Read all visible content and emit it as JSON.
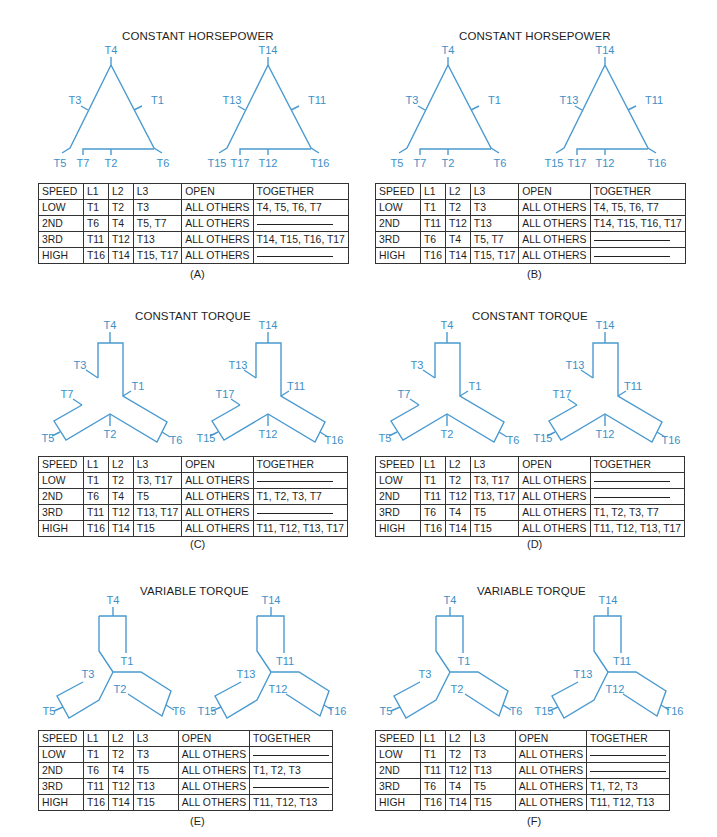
{
  "wire_color": "#4a9ad0",
  "panels": [
    {
      "id": "A",
      "caption": "(A)",
      "title": "CONSTANT HORSEPOWER",
      "type": "delta",
      "left_labels": {
        "top": "T4",
        "left": "T3",
        "right": "T1",
        "bl": "T5",
        "bm1": "T7",
        "bm2": "T2",
        "br": "T6"
      },
      "right_labels": {
        "top": "T14",
        "left": "T13",
        "right": "T11",
        "bl": "T15",
        "bm1": "T17",
        "bm2": "T12",
        "br": "T16"
      },
      "table": {
        "headers": [
          "SPEED",
          "L1",
          "L2",
          "L3",
          "OPEN",
          "TOGETHER"
        ],
        "rows": [
          [
            "LOW",
            "T1",
            "T2",
            "T3",
            "ALL OTHERS",
            "T4, T5, T6, T7"
          ],
          [
            "2ND",
            "T6",
            "T4",
            "T5, T7",
            "ALL OTHERS",
            "—"
          ],
          [
            "3RD",
            "T11",
            "T12",
            "T13",
            "ALL OTHERS",
            "T14, T15, T16, T17"
          ],
          [
            "HIGH",
            "T16",
            "T14",
            "T15, T17",
            "ALL OTHERS",
            "—"
          ]
        ]
      }
    },
    {
      "id": "B",
      "caption": "(B)",
      "title": "CONSTANT HORSEPOWER",
      "type": "delta",
      "left_labels": {
        "top": "T4",
        "left": "T3",
        "right": "T1",
        "bl": "T5",
        "bm1": "T7",
        "bm2": "T2",
        "br": "T6"
      },
      "right_labels": {
        "top": "T14",
        "left": "T13",
        "right": "T11",
        "bl": "T15",
        "bm1": "T17",
        "bm2": "T12",
        "br": "T16"
      },
      "table": {
        "headers": [
          "SPEED",
          "L1",
          "L2",
          "L3",
          "OPEN",
          "TOGETHER"
        ],
        "rows": [
          [
            "LOW",
            "T1",
            "T2",
            "T3",
            "ALL OTHERS",
            "T4, T5, T6, T7"
          ],
          [
            "2ND",
            "T11",
            "T12",
            "T13",
            "ALL OTHERS",
            "T14, T15, T16, T17"
          ],
          [
            "3RD",
            "T6",
            "T4",
            "T5, T7",
            "ALL OTHERS",
            "—"
          ],
          [
            "HIGH",
            "T16",
            "T14",
            "T15, T17",
            "ALL OTHERS",
            "—"
          ]
        ]
      }
    },
    {
      "id": "C",
      "caption": "(C)",
      "title": "CONSTANT TORQUE",
      "type": "wye-ct",
      "left_labels": {
        "top": "T4",
        "t3": "T3",
        "t1": "T1",
        "t7": "T7",
        "bl": "T5",
        "bm": "T2",
        "br": "T6"
      },
      "right_labels": {
        "top": "T14",
        "t3": "T13",
        "t1": "T11",
        "t7": "T17",
        "bl": "T15",
        "bm": "T12",
        "br": "T16"
      },
      "table": {
        "headers": [
          "SPEED",
          "L1",
          "L2",
          "L3",
          "OPEN",
          "TOGETHER"
        ],
        "rows": [
          [
            "LOW",
            "T1",
            "T2",
            "T3, T17",
            "ALL OTHERS",
            "—"
          ],
          [
            "2ND",
            "T6",
            "T4",
            "T5",
            "ALL OTHERS",
            "T1, T2, T3, T7"
          ],
          [
            "3RD",
            "T11",
            "T12",
            "T13, T17",
            "ALL OTHERS",
            "—"
          ],
          [
            "HIGH",
            "T16",
            "T14",
            "T15",
            "ALL OTHERS",
            "T11, T12, T13, T17"
          ]
        ]
      }
    },
    {
      "id": "D",
      "caption": "(D)",
      "title": "CONSTANT TORQUE",
      "type": "wye-ct",
      "left_labels": {
        "top": "T4",
        "t3": "T3",
        "t1": "T1",
        "t7": "T7",
        "bl": "T5",
        "bm": "T2",
        "br": "T6"
      },
      "right_labels": {
        "top": "T14",
        "t3": "T13",
        "t1": "T11",
        "t7": "T17",
        "bl": "T15",
        "bm": "T12",
        "br": "T16"
      },
      "table": {
        "headers": [
          "SPEED",
          "L1",
          "L2",
          "L3",
          "OPEN",
          "TOGETHER"
        ],
        "rows": [
          [
            "LOW",
            "T1",
            "T2",
            "T3, T17",
            "ALL OTHERS",
            "—"
          ],
          [
            "2ND",
            "T11",
            "T12",
            "T13, T17",
            "ALL OTHERS",
            "—"
          ],
          [
            "3RD",
            "T6",
            "T4",
            "T5",
            "ALL OTHERS",
            "T1, T2, T3, T7"
          ],
          [
            "HIGH",
            "T16",
            "T14",
            "T15",
            "ALL OTHERS",
            "T11, T12, T13, T17"
          ]
        ]
      }
    },
    {
      "id": "E",
      "caption": "(E)",
      "title": "VARIABLE TORQUE",
      "type": "wye-vt",
      "left_labels": {
        "top": "T4",
        "t1": "T1",
        "t3": "T3",
        "t2": "T2",
        "bl": "T5",
        "br": "T6"
      },
      "right_labels": {
        "top": "T14",
        "t1": "T11",
        "t3": "T13",
        "t2": "T12",
        "bl": "T15",
        "br": "T16"
      },
      "table": {
        "headers": [
          "SPEED",
          "L1",
          "L2",
          "L3",
          "OPEN",
          "TOGETHER"
        ],
        "rows": [
          [
            "LOW",
            "T1",
            "T2",
            "T3",
            "ALL OTHERS",
            "—"
          ],
          [
            "2ND",
            "T6",
            "T4",
            "T5",
            "ALL OTHERS",
            "T1, T2, T3"
          ],
          [
            "3RD",
            "T11",
            "T12",
            "T13",
            "ALL OTHERS",
            "—"
          ],
          [
            "HIGH",
            "T16",
            "T14",
            "T15",
            "ALL OTHERS",
            "T11, T12, T13"
          ]
        ]
      }
    },
    {
      "id": "F",
      "caption": "(F)",
      "title": "VARIABLE TORQUE",
      "type": "wye-vt",
      "left_labels": {
        "top": "T4",
        "t1": "T1",
        "t3": "T3",
        "t2": "T2",
        "bl": "T5",
        "br": "T6"
      },
      "right_labels": {
        "top": "T14",
        "t1": "T11",
        "t3": "T13",
        "t2": "T12",
        "bl": "T15",
        "br": "T16"
      },
      "table": {
        "headers": [
          "SPEED",
          "L1",
          "L2",
          "L3",
          "OPEN",
          "TOGETHER"
        ],
        "rows": [
          [
            "LOW",
            "T1",
            "T2",
            "T3",
            "ALL OTHERS",
            "—"
          ],
          [
            "2ND",
            "T11",
            "T12",
            "T13",
            "ALL OTHERS",
            "—"
          ],
          [
            "3RD",
            "T6",
            "T4",
            "T5",
            "ALL OTHERS",
            "T1, T2, T3"
          ],
          [
            "HIGH",
            "T16",
            "T14",
            "T15",
            "ALL OTHERS",
            "T11, T12, T13"
          ]
        ]
      }
    }
  ]
}
